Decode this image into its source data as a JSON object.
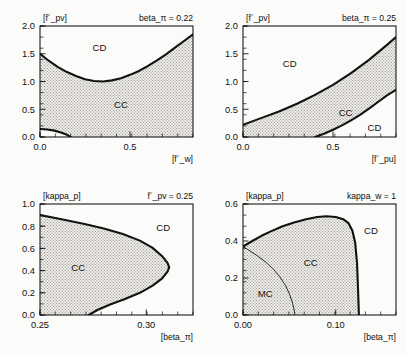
{
  "figure": {
    "background": "#fbfbfa",
    "curve_color": "#111111",
    "shade_color": "#d8d6d2",
    "panel_count": 4
  },
  "chart_data": [
    {
      "type": "line",
      "panel": "top-left",
      "title": "beta_π = 0.22",
      "xlabel": "[f´_w]",
      "ylabel": "[f´_pv]",
      "xlim": [
        0.0,
        0.85
      ],
      "ylim": [
        0.0,
        2.0
      ],
      "xticks": [
        0.0,
        0.5
      ],
      "xtick_labels": [
        "0.0",
        "0.5"
      ],
      "yticks": [
        0.0,
        0.5,
        1.0,
        1.5,
        2.0
      ],
      "ytick_labels": [
        "0.0",
        "0.5",
        "1.0",
        "1.5",
        "2.0"
      ],
      "grid": false,
      "legend": "none",
      "regions": [
        {
          "label": "CD",
          "x": 0.33,
          "y": 1.62,
          "shaded": false
        },
        {
          "label": "CC",
          "x": 0.45,
          "y": 0.58,
          "shaded": true
        }
      ],
      "series": [
        {
          "name": "upper-phase-boundary",
          "x": [
            0.0,
            0.05,
            0.1,
            0.15,
            0.2,
            0.25,
            0.3,
            0.35,
            0.4,
            0.45,
            0.5,
            0.55,
            0.6,
            0.65,
            0.7,
            0.75,
            0.8,
            0.85
          ],
          "y": [
            1.5,
            1.37,
            1.26,
            1.17,
            1.1,
            1.04,
            1.01,
            1.0,
            1.02,
            1.06,
            1.12,
            1.19,
            1.28,
            1.38,
            1.49,
            1.61,
            1.73,
            1.85
          ]
        },
        {
          "name": "lower-phase-boundary",
          "x": [
            0.0,
            0.04,
            0.08,
            0.12,
            0.15,
            0.17
          ],
          "y": [
            0.145,
            0.135,
            0.115,
            0.078,
            0.04,
            0.0
          ]
        }
      ]
    },
    {
      "type": "line",
      "panel": "top-right",
      "title": "beta_π = 0.25",
      "xlabel": "[f´_pu]",
      "ylabel": "[f´_pv]",
      "xlim": [
        0.0,
        0.85
      ],
      "ylim": [
        0.0,
        2.0
      ],
      "xticks": [
        0.0,
        0.5
      ],
      "xtick_labels": [
        "0.0",
        "0.5"
      ],
      "yticks": [
        0.0,
        0.5,
        1.0,
        1.5,
        2.0
      ],
      "ytick_labels": [
        "0.0",
        "0.5",
        "1.0",
        "1.5",
        "2.0"
      ],
      "grid": false,
      "legend": "none",
      "regions": [
        {
          "label": "CD",
          "x": 0.26,
          "y": 1.33,
          "shaded": false
        },
        {
          "label": "CC",
          "x": 0.57,
          "y": 0.45,
          "shaded": true
        },
        {
          "label": "CD",
          "x": 0.73,
          "y": 0.18,
          "shaded": false
        }
      ],
      "series": [
        {
          "name": "upper-phase-boundary",
          "x": [
            0.0,
            0.1,
            0.2,
            0.3,
            0.4,
            0.5,
            0.6,
            0.7,
            0.8,
            0.85
          ],
          "y": [
            0.22,
            0.34,
            0.46,
            0.6,
            0.76,
            0.94,
            1.15,
            1.39,
            1.66,
            1.8
          ]
        },
        {
          "name": "lower-phase-boundary",
          "x": [
            0.4,
            0.45,
            0.5,
            0.55,
            0.6,
            0.65,
            0.7,
            0.75,
            0.8,
            0.85
          ],
          "y": [
            0.0,
            0.06,
            0.13,
            0.21,
            0.3,
            0.4,
            0.51,
            0.63,
            0.75,
            0.85
          ]
        }
      ]
    },
    {
      "type": "line",
      "panel": "bottom-left",
      "title": "f´_pv = 0.25",
      "xlabel": "[beta_π]",
      "ylabel": "[kappa_p]",
      "xlim": [
        0.25,
        0.322
      ],
      "ylim": [
        0.0,
        1.0
      ],
      "xticks": [
        0.25,
        0.3
      ],
      "xtick_labels": [
        "0.25",
        "0.30"
      ],
      "yticks": [
        0.0,
        0.2,
        0.4,
        0.6,
        0.8,
        1.0
      ],
      "ytick_labels": [
        "0.0",
        "0.2",
        "0.4",
        "0.6",
        "0.8",
        "1.0"
      ],
      "grid": false,
      "legend": "none",
      "regions": [
        {
          "label": "CC",
          "x": 0.268,
          "y": 0.43,
          "shaded": true
        },
        {
          "label": "CD",
          "x": 0.308,
          "y": 0.79,
          "shaded": false
        }
      ],
      "series": [
        {
          "name": "phase-boundary",
          "x": [
            0.25,
            0.256,
            0.263,
            0.271,
            0.28,
            0.289,
            0.297,
            0.303,
            0.3075,
            0.31,
            0.3108,
            0.31,
            0.3075,
            0.303,
            0.297,
            0.29,
            0.283,
            0.277,
            0.273
          ],
          "y": [
            0.9,
            0.878,
            0.852,
            0.82,
            0.78,
            0.73,
            0.67,
            0.605,
            0.53,
            0.47,
            0.43,
            0.39,
            0.33,
            0.265,
            0.2,
            0.145,
            0.095,
            0.045,
            0.0
          ]
        }
      ]
    },
    {
      "type": "line",
      "panel": "bottom-right",
      "title": "kappa_w = 1",
      "xlabel": "[beta_π]",
      "ylabel": "[kappa_p]",
      "xlim": [
        0.0,
        0.165
      ],
      "ylim": [
        0.0,
        0.6
      ],
      "xticks": [
        0.0,
        0.1
      ],
      "xtick_labels": [
        "0.00",
        "0.10"
      ],
      "yticks": [
        0.0,
        0.2,
        0.4,
        0.6
      ],
      "ytick_labels": [
        "0.0",
        "0.2",
        "0.4",
        "0.6"
      ],
      "grid": false,
      "legend": "none",
      "regions": [
        {
          "label": "CD",
          "x": 0.138,
          "y": 0.455,
          "shaded": false
        },
        {
          "label": "CC",
          "x": 0.073,
          "y": 0.285,
          "shaded": true
        },
        {
          "label": "MC",
          "x": 0.024,
          "y": 0.115,
          "shaded": true
        }
      ],
      "series": [
        {
          "name": "outer-phase-boundary",
          "x": [
            0.0,
            0.01,
            0.02,
            0.03,
            0.042,
            0.055,
            0.068,
            0.08,
            0.09,
            0.1,
            0.108,
            0.114,
            0.118,
            0.121,
            0.123,
            0.124,
            0.125
          ],
          "y": [
            0.37,
            0.4,
            0.428,
            0.452,
            0.478,
            0.5,
            0.518,
            0.53,
            0.534,
            0.53,
            0.518,
            0.495,
            0.455,
            0.39,
            0.28,
            0.15,
            0.0
          ]
        },
        {
          "name": "mc-cc-boundary",
          "x": [
            0.0,
            0.008,
            0.016,
            0.024,
            0.032,
            0.04,
            0.046,
            0.05,
            0.053,
            0.055,
            0.056
          ],
          "y": [
            0.37,
            0.345,
            0.318,
            0.288,
            0.252,
            0.205,
            0.158,
            0.115,
            0.072,
            0.032,
            0.0
          ]
        }
      ]
    }
  ]
}
